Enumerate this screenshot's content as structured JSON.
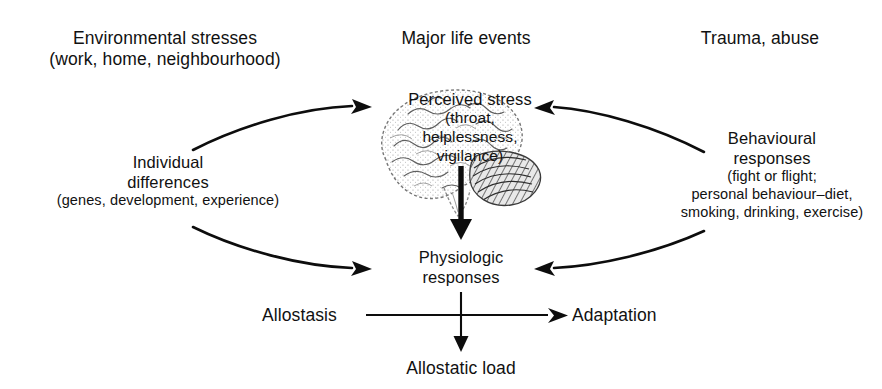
{
  "figure": {
    "background_color": "#ffffff",
    "ink_color": "#0d0d0d"
  },
  "inputs": {
    "environmental_stresses": {
      "line1": "Environmental stresses",
      "line2": "(work, home, neighbourhood)"
    },
    "major_life_events": {
      "line1": "Major life events"
    },
    "trauma_abuse": {
      "line1": "Trauma, abuse"
    }
  },
  "moderators": {
    "individual_differences": {
      "line1": "Individual",
      "line2": "differences",
      "line3": "(genes, development, experience)"
    },
    "behavioural_responses": {
      "line1": "Behavioural",
      "line2": "responses",
      "line3": "(fight or flight;",
      "line4": "personal behaviour–diet,",
      "line5": "smoking, drinking, exercise)"
    }
  },
  "core": {
    "perceived_stress": {
      "line1": "Perceived stress",
      "line2": "(throat,",
      "line3": "helplessness,",
      "line4": "vigilance)"
    },
    "physiologic_responses": {
      "line1": "Physiologic",
      "line2": "responses"
    }
  },
  "outcomes": {
    "allostasis": "Allostasis",
    "adaptation": "Adaptation",
    "allostatic_load": "Allostatic load"
  },
  "graphics": {
    "brain_icon": "brain-illustration",
    "arrow_to_perceived_stress_left": "curved-arrow-right",
    "arrow_to_perceived_stress_right": "curved-arrow-left",
    "arrow_to_physiologic_left": "curved-arrow-right",
    "arrow_to_physiologic_right": "curved-arrow-left",
    "arrow_stress_to_physiologic": "thick-down-arrow",
    "arrow_allostasis_to_adaptation": "right-arrow",
    "arrow_to_allostatic_load": "down-arrow"
  }
}
